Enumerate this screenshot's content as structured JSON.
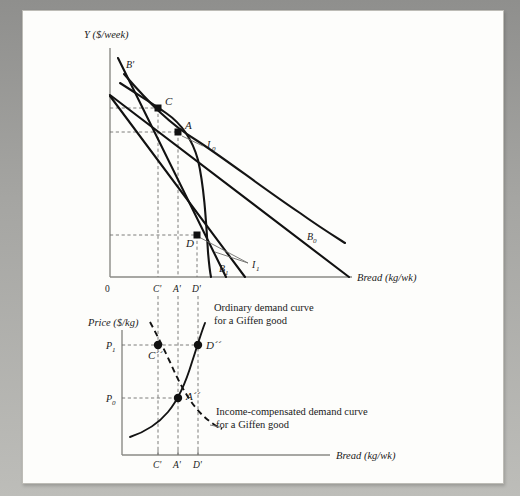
{
  "figure": {
    "upper": {
      "y_axis_label": "Y ($/week)",
      "x_axis_label": "Bread (kg/wk)",
      "origin_label": "0",
      "x_ticks": [
        "C'",
        "A'",
        "D'"
      ],
      "points": [
        {
          "id": "C",
          "label": "C",
          "x": 158,
          "y": 108
        },
        {
          "id": "A",
          "label": "A",
          "x": 178,
          "y": 132
        },
        {
          "id": "D",
          "label": "D",
          "x": 197,
          "y": 235
        }
      ],
      "curves": [
        {
          "id": "B0",
          "label": "B",
          "sub": "0",
          "type": "budget"
        },
        {
          "id": "B1",
          "label": "B",
          "sub": "1",
          "type": "budget"
        },
        {
          "id": "Bprime",
          "label": "B'",
          "sub": "",
          "type": "budget-compensated"
        },
        {
          "id": "I0",
          "label": "I",
          "sub": "0",
          "type": "indifference"
        },
        {
          "id": "I1",
          "label": "I",
          "sub": "1",
          "type": "indifference"
        }
      ]
    },
    "lower": {
      "y_axis_label": "Price ($/kg)",
      "x_axis_label": "Bread (kg/wk)",
      "y_ticks": [
        {
          "label": "P",
          "sub": "1"
        },
        {
          "label": "P",
          "sub": "0"
        }
      ],
      "x_ticks": [
        "C'",
        "A'",
        "D'"
      ],
      "points": [
        {
          "id": "Cpp",
          "label": "C´´",
          "x": 158,
          "y": 345
        },
        {
          "id": "Dpp",
          "label": "D´´",
          "x": 198,
          "y": 345
        },
        {
          "id": "App",
          "label": "A´´",
          "x": 178,
          "y": 398
        }
      ],
      "annotations": [
        {
          "id": "ordinary",
          "line1": "Ordinary demand curve",
          "line2": "for a Giffen good"
        },
        {
          "id": "income-compensated",
          "line1": "Income-compensated demand curve",
          "line2": "for a Giffen good"
        }
      ]
    }
  }
}
